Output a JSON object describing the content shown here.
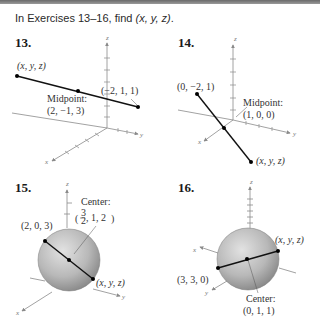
{
  "heading": {
    "prefix": "In Exercises 13–16, find ",
    "target": "(x, y, z)",
    "suffix": "."
  },
  "exercises": [
    {
      "number": "13.",
      "type": "segment",
      "labels": {
        "endpoint_unknown": "(x, y, z)",
        "endpoint_known": "(−2, 1, 1)",
        "midpoint_title": "Midpoint:",
        "midpoint_value": "(2, −1, 3)"
      },
      "axes": {
        "x": "x",
        "y": "y",
        "z": "z"
      }
    },
    {
      "number": "14.",
      "type": "segment",
      "labels": {
        "endpoint_known": "(0, −2, 1)",
        "midpoint_title": "Midpoint:",
        "midpoint_value": "(1, 0, 0)",
        "endpoint_unknown": "(x, y, z)"
      },
      "axes": {
        "x": "x",
        "y": "y",
        "z": "z"
      }
    },
    {
      "number": "15.",
      "type": "sphere",
      "labels": {
        "endpoint_known": "(2, 0, 3)",
        "center_title": "Center:",
        "center_value_frac_num": "3",
        "center_value_frac_den": "2",
        "center_value_rest": ", 1, 2",
        "endpoint_unknown": "(x, y, z)"
      },
      "axes": {
        "x": "x",
        "y": "y",
        "z": "z"
      }
    },
    {
      "number": "16.",
      "type": "sphere",
      "labels": {
        "endpoint_unknown": "(x, y, z)",
        "endpoint_known": "(3, 3, 0)",
        "center_title": "Center:",
        "center_value": "(0, 1, 1)"
      },
      "axes": {
        "x": "x",
        "y": "y",
        "z": "z"
      }
    }
  ],
  "colors": {
    "sphere_light": "#d9d9d9",
    "sphere_dark": "#8c8c8c",
    "axis": "#8a8a8a",
    "segment": "#111111"
  }
}
